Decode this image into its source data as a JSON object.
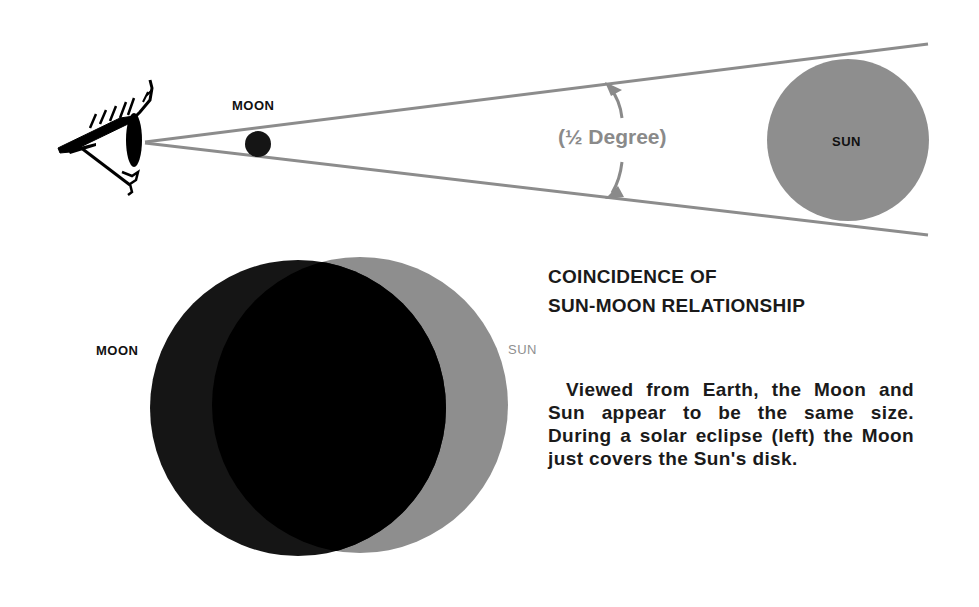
{
  "top_diagram": {
    "moon_label": "MOON",
    "angle_label": "(½ Degree)",
    "sun_label": "SUN"
  },
  "eclipse_diagram": {
    "moon_label": "MOON",
    "sun_label": "SUN"
  },
  "caption": {
    "title_line1": "COINCIDENCE OF",
    "title_line2": "SUN-MOON RELATIONSHIP",
    "body": "Viewed from Earth, the Moon and Sun appear to be the same size. During a solar eclipse (left) the Moon just covers the Sun's disk."
  },
  "colors": {
    "sight_lines": "#8c8c8c",
    "sun_fill": "#8e8e8e",
    "moon_fill": "#151515",
    "overlap_fill": "#000000",
    "angle_label": "#8a8a8a"
  }
}
